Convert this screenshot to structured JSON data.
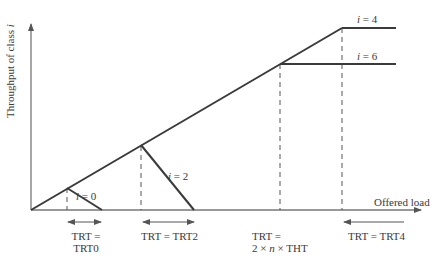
{
  "axes": {
    "y_label_prefix": "Throughput of class ",
    "y_label_var": "i",
    "x_label": "Offered load"
  },
  "curves": [
    {
      "id": "i0",
      "label_var": "i",
      "label_eq": " = 0"
    },
    {
      "id": "i2",
      "label_var": "i",
      "label_eq": " = 2"
    },
    {
      "id": "i4",
      "label_var": "i",
      "label_eq": " = 4"
    },
    {
      "id": "i6",
      "label_var": "i",
      "label_eq": " = 6"
    }
  ],
  "annotations": {
    "trt0_line1": "TRT =",
    "trt0_line2": "TRT0",
    "trt2": "TRT = TRT2",
    "tht_line1": "TRT =",
    "tht_line2_a": "2 × ",
    "tht_line2_n": "n",
    "tht_line2_b": " × THT",
    "trt4": "TRT = TRT4"
  },
  "colors": {
    "line": "#3a3a3a",
    "axis": "#555555"
  }
}
